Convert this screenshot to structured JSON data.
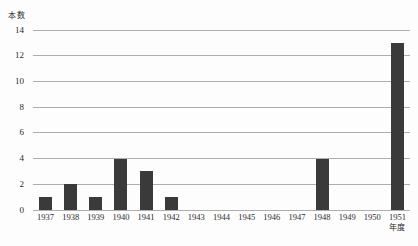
{
  "chart_data": {
    "type": "bar",
    "title": "",
    "ylabel": "本数",
    "xlabel": "年度",
    "categories": [
      "1937",
      "1938",
      "1939",
      "1940",
      "1941",
      "1942",
      "1943",
      "1944",
      "1945",
      "1946",
      "1947",
      "1948",
      "1949",
      "1950",
      "1951"
    ],
    "values": [
      1,
      2,
      1,
      4,
      3,
      1,
      0,
      0,
      0,
      0,
      0,
      4,
      0,
      0,
      13
    ],
    "ylim": [
      0,
      14
    ],
    "ytick_step": 2,
    "grid": true,
    "legend": "none",
    "bar_color": "#3a3a3a",
    "grid_color": "#aeaeae",
    "text_color": "#2b2b2b",
    "background_color": "#fdfdfd"
  }
}
